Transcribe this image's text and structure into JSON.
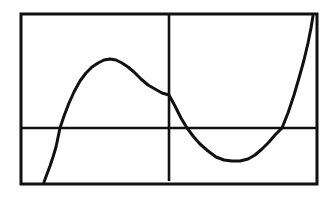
{
  "image": {
    "width": 335,
    "height": 201,
    "background_color": "#ffffff",
    "ink_color": "#111111",
    "description": "Graphing calculator style plot of a cubic function inside a rectangular screen frame"
  },
  "frame": {
    "name": "calculator-screen-frame",
    "x": 21,
    "y": 14,
    "width": 296,
    "height": 170,
    "stroke_width": 3,
    "stroke_color": "#111111",
    "fill": "#ffffff"
  },
  "chart_data": {
    "type": "line",
    "title": "",
    "subtitle": "",
    "xlabel": "",
    "ylabel": "",
    "grid": false,
    "legend": null,
    "legend_position": "none",
    "axes": {
      "x_axis": {
        "name": "x-axis",
        "orientation": "horizontal",
        "pixel_y": 128,
        "pixel_x_start": 21,
        "pixel_x_end": 317,
        "stroke_width": 2.6,
        "stroke_color": "#111111",
        "ticks": [],
        "tick_labels": []
      },
      "y_axis": {
        "name": "y-axis",
        "orientation": "vertical",
        "pixel_x": 169,
        "pixel_y_start": 15,
        "pixel_y_end": 181,
        "stroke_width": 2.6,
        "stroke_color": "#111111",
        "ticks": [],
        "tick_labels": []
      }
    },
    "xlim": [
      21,
      317
    ],
    "ylim": [
      184,
      14
    ],
    "series": [
      {
        "name": "cubic-curve",
        "stroke_color": "#111111",
        "stroke_width": 3,
        "points_pixel": [
          [
            44,
            182
          ],
          [
            47,
            174
          ],
          [
            50,
            166
          ],
          [
            53,
            157
          ],
          [
            56,
            147
          ],
          [
            60,
            128
          ],
          [
            64,
            116
          ],
          [
            69,
            103
          ],
          [
            74,
            92
          ],
          [
            80,
            81
          ],
          [
            86,
            73
          ],
          [
            92,
            67
          ],
          [
            98,
            63
          ],
          [
            104,
            60
          ],
          [
            110,
            59
          ],
          [
            116,
            60
          ],
          [
            122,
            63
          ],
          [
            128,
            67
          ],
          [
            134,
            72
          ],
          [
            141,
            79
          ],
          [
            148,
            85
          ],
          [
            155,
            89
          ],
          [
            162,
            93
          ],
          [
            169,
            95
          ],
          [
            175,
            106
          ],
          [
            181,
            118
          ],
          [
            187,
            128
          ],
          [
            193,
            136
          ],
          [
            200,
            144
          ],
          [
            208,
            151
          ],
          [
            216,
            157
          ],
          [
            224,
            160
          ],
          [
            232,
            161
          ],
          [
            240,
            161
          ],
          [
            248,
            159
          ],
          [
            255,
            155
          ],
          [
            262,
            149
          ],
          [
            269,
            142
          ],
          [
            275,
            135
          ],
          [
            282,
            128
          ],
          [
            288,
            113
          ],
          [
            294,
            95
          ],
          [
            299,
            78
          ],
          [
            304,
            60
          ],
          [
            308,
            43
          ],
          [
            311,
            28
          ],
          [
            313,
            16
          ]
        ],
        "key_features": {
          "local_maximum_pixel": [
            110,
            59
          ],
          "local_minimum_pixel": [
            238,
            161
          ],
          "y_intercept_pixel": [
            169,
            95
          ],
          "x_intercepts_pixel": [
            [
              60,
              128
            ],
            [
              187,
              128
            ],
            [
              282,
              128
            ]
          ],
          "left_endpoint_pixel": [
            44,
            182
          ],
          "right_endpoint_pixel": [
            313,
            16
          ]
        }
      }
    ]
  }
}
